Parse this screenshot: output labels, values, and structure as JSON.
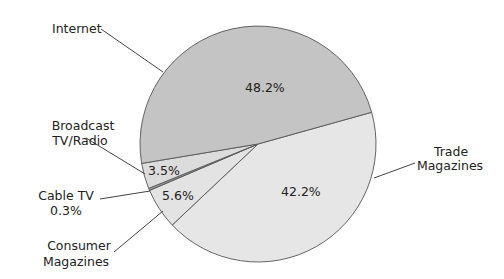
{
  "chart_data": {
    "type": "pie",
    "title": "",
    "categories": [
      "Internet",
      "Trade Magazines",
      "Consumer Magazines",
      "Cable TV",
      "Broadcast TV/Radio"
    ],
    "values": [
      48.2,
      42.2,
      5.6,
      0.3,
      3.5
    ],
    "unit": "%",
    "slices": [
      {
        "label": "Internet",
        "value": 48.2,
        "value_label": "48.2%",
        "color": "#c4c4c4"
      },
      {
        "label": "Trade Magazines",
        "value": 42.2,
        "value_label": "42.2%",
        "color": "#e6e6e6"
      },
      {
        "label": "Consumer Magazines",
        "value": 5.6,
        "value_label": "5.6%",
        "color": "#e3e3e3"
      },
      {
        "label": "Cable TV",
        "value": 0.3,
        "value_label": "0.3%",
        "color": "#9a9a9a"
      },
      {
        "label": "Broadcast TV/Radio",
        "value": 3.5,
        "value_label": "3.5%",
        "color": "#dcdcdc"
      }
    ],
    "legend": "none (callout labels with leader lines)",
    "label_lines": {
      "internet": "Internet",
      "broadcast_1": "Broadcast",
      "broadcast_2": "TV/Radio",
      "cable_1": "Cable TV",
      "cable_2": "0.3%",
      "consumer_1": "Consumer",
      "consumer_2": "Magazines",
      "trade_1": "Trade",
      "trade_2": "Magazines"
    },
    "inside_labels": {
      "internet": "48.2%",
      "trade": "42.2%",
      "consumer": "5.6%",
      "broadcast": "3.5%"
    }
  }
}
